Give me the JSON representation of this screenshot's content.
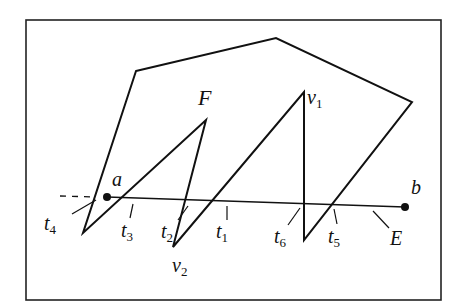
{
  "figure": {
    "frame": {
      "x": 26,
      "y": 20,
      "w": 415,
      "h": 280
    },
    "region_label": "F",
    "polygon_F": [
      [
        136,
        71
      ],
      [
        276,
        38
      ],
      [
        412,
        102
      ],
      [
        304,
        240
      ],
      [
        304,
        92
      ],
      [
        173,
        247
      ],
      [
        206,
        120
      ],
      [
        83,
        233
      ]
    ],
    "segment_E": {
      "label": "E",
      "a": {
        "label": "a",
        "x": 107,
        "y": 197
      },
      "b": {
        "label": "b",
        "x": 405,
        "y": 207
      }
    },
    "dashed_extension": {
      "x1": 60,
      "y1": 196,
      "x2": 95,
      "y2": 197
    },
    "vertices": [
      {
        "label": "v",
        "sub": "1",
        "x": 307,
        "y": 80
      },
      {
        "label": "v",
        "sub": "2",
        "x": 172,
        "y": 272
      }
    ],
    "intersections": [
      {
        "label": "t",
        "sub": "1",
        "x": 216,
        "y": 240
      },
      {
        "label": "t",
        "sub": "2",
        "x": 161,
        "y": 241
      },
      {
        "label": "t",
        "sub": "3",
        "x": 121,
        "y": 240
      },
      {
        "label": "t",
        "sub": "4",
        "x": 44,
        "y": 230
      },
      {
        "label": "t",
        "sub": "5",
        "x": 328,
        "y": 245
      },
      {
        "label": "t",
        "sub": "6",
        "x": 274,
        "y": 245
      }
    ],
    "colors": {
      "stroke": "#111111",
      "background": "#ffffff"
    }
  }
}
